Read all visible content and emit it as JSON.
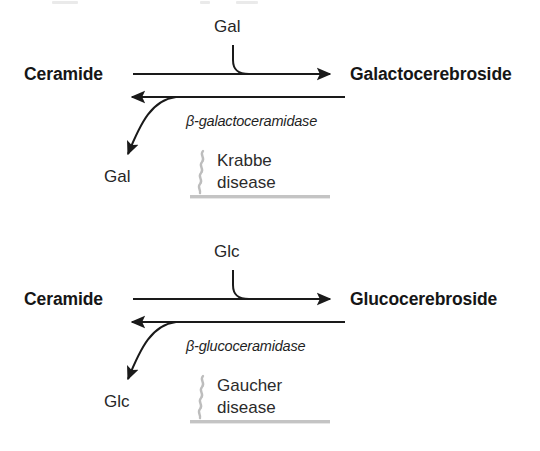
{
  "figure": {
    "blocks": [
      {
        "substrate": "Ceramide",
        "product": "Galactocerebroside",
        "sugar_in": "Gal",
        "sugar_out": "Gal",
        "enzyme": "β-galactoceramidase",
        "disease_line1": "Krabbe",
        "disease_line2": "disease"
      },
      {
        "substrate": "Ceramide",
        "product": "Glucocerebroside",
        "sugar_in": "Glc",
        "sugar_out": "Glc",
        "enzyme": "β-glucoceramidase",
        "disease_line1": "Gaucher",
        "disease_line2": "disease"
      }
    ]
  },
  "colors": {
    "ink": "#161616",
    "arrow": "#1a1a1a",
    "block_marker": "#b8b8b8",
    "background": "#ffffff"
  }
}
